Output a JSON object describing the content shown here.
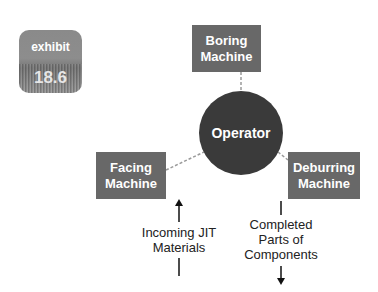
{
  "badge": {
    "line1": "exhibit",
    "line2": "18.6",
    "color": "#8a8a8a"
  },
  "nodes": {
    "boring": "Boring\nMachine",
    "operator": "Operator",
    "facing": "Facing\nMachine",
    "deburring": "Deburring\nMachine"
  },
  "labels": {
    "incoming": "Incoming JIT\nMaterials",
    "completed": "Completed\nParts of\nComponents"
  },
  "colors": {
    "machine_box": "#686868",
    "operator_circle": "#3a3a3a",
    "connector": "#999999"
  }
}
